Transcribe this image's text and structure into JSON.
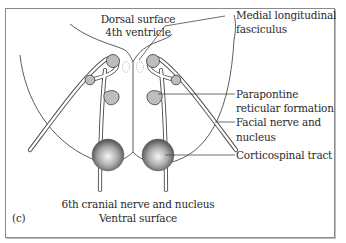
{
  "figure": {
    "panel_label": "(c)",
    "top_labels": {
      "line1": "Dorsal surface",
      "line2": "4th ventricle"
    },
    "bottom_labels": {
      "line1": "6th cranial nerve and nucleus",
      "line2": "Ventral surface"
    },
    "callouts": [
      {
        "line1": "Medial longitudinal",
        "line2": "fasciculus"
      },
      {
        "line1": "Parapontine",
        "line2": "reticular formation"
      },
      {
        "line1": "Facial nerve and",
        "line2": "nucleus"
      },
      {
        "line1": "Corticospinal tract",
        "line2": ""
      }
    ]
  },
  "colors": {
    "outline": "#4a4a4a",
    "nucleus_fill": "#b9b9b9",
    "sphere_light": "#f4f4f4",
    "sphere_dark": "#5a5a5a",
    "frame": "#8a8a8a"
  }
}
